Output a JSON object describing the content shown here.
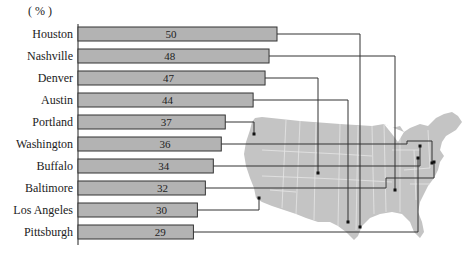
{
  "chart_data": {
    "type": "bar",
    "orientation": "horizontal",
    "title": "",
    "unit_label": "( % )",
    "xlabel": "",
    "ylabel": "",
    "categories": [
      "Houston",
      "Nashville",
      "Denver",
      "Austin",
      "Portland",
      "Washington",
      "Buffalo",
      "Baltimore",
      "Los Angeles",
      "Pittsburgh"
    ],
    "values": [
      50,
      48,
      47,
      44,
      37,
      36,
      34,
      32,
      30,
      29
    ],
    "grid": false,
    "legend": null,
    "annotations": "Each bar is connected by a leader line to the city's location on a map of the contiguous United States",
    "colors": {
      "bar_fill": "#b3b3b3",
      "bar_stroke": "#333333",
      "map_fill": "#c4c4c4",
      "map_border": "#e6e6e6",
      "leader_line": "#333333"
    }
  },
  "labels": {
    "unit": "( % )"
  }
}
